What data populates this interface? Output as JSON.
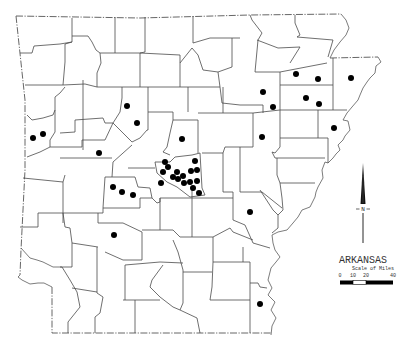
{
  "map": {
    "title": "ARKANSAS",
    "scale": {
      "label": "Scale of Miles",
      "ticks": [
        "0",
        "10",
        "20",
        "40"
      ],
      "segments": [
        {
          "from": "0",
          "to": "10",
          "color": "#000000"
        },
        {
          "from": "10",
          "to": "20",
          "color": "#ffffff"
        },
        {
          "from": "20",
          "to": "40",
          "color": "#000000"
        }
      ]
    },
    "compass": {
      "label": "N"
    },
    "colors": {
      "dots": "#000000",
      "lines": "#4a4a4a",
      "background": "#ffffff"
    },
    "points": [
      {
        "x": 33,
        "y": 138
      },
      {
        "x": 43,
        "y": 134
      },
      {
        "x": 127,
        "y": 106
      },
      {
        "x": 137,
        "y": 123
      },
      {
        "x": 99,
        "y": 153
      },
      {
        "x": 182,
        "y": 139
      },
      {
        "x": 165,
        "y": 162
      },
      {
        "x": 168,
        "y": 167
      },
      {
        "x": 163,
        "y": 172
      },
      {
        "x": 161,
        "y": 183
      },
      {
        "x": 173,
        "y": 177
      },
      {
        "x": 177,
        "y": 172
      },
      {
        "x": 178,
        "y": 179
      },
      {
        "x": 183,
        "y": 176
      },
      {
        "x": 184,
        "y": 183
      },
      {
        "x": 191,
        "y": 171
      },
      {
        "x": 197,
        "y": 170
      },
      {
        "x": 195,
        "y": 161
      },
      {
        "x": 190,
        "y": 182
      },
      {
        "x": 197,
        "y": 181
      },
      {
        "x": 193,
        "y": 188
      },
      {
        "x": 199,
        "y": 193
      },
      {
        "x": 113,
        "y": 187
      },
      {
        "x": 122,
        "y": 192
      },
      {
        "x": 133,
        "y": 195
      },
      {
        "x": 114,
        "y": 235
      },
      {
        "x": 250,
        "y": 212
      },
      {
        "x": 260,
        "y": 304
      },
      {
        "x": 296,
        "y": 74
      },
      {
        "x": 318,
        "y": 79
      },
      {
        "x": 351,
        "y": 78
      },
      {
        "x": 263,
        "y": 92
      },
      {
        "x": 273,
        "y": 107
      },
      {
        "x": 306,
        "y": 98
      },
      {
        "x": 319,
        "y": 104
      },
      {
        "x": 334,
        "y": 128
      },
      {
        "x": 262,
        "y": 137
      }
    ]
  }
}
